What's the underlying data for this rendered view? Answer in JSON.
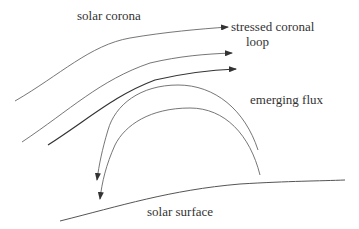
{
  "diagram": {
    "labels": {
      "corona": "solar corona",
      "loop_line1": "stressed coronal",
      "loop_line2": "loop",
      "flux": "emerging flux",
      "surface": "solar surface"
    },
    "colors": {
      "line": "#555555",
      "line_dark": "#333333",
      "text": "#333333"
    }
  }
}
